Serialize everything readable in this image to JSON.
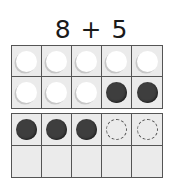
{
  "title": "8 + 5",
  "colors": {
    "counter_white": "#ffffff",
    "counter_dark": "#3e3e3e",
    "counter_dashed_outline": "#555555",
    "cell_background": "#ebebeb",
    "grid_lines": "#555555"
  },
  "frames": [
    {
      "name": "first-ten-frame",
      "rows": [
        [
          "white",
          "white",
          "white",
          "white",
          "white"
        ],
        [
          "white",
          "white",
          "white",
          "dark",
          "dark"
        ]
      ]
    },
    {
      "name": "second-ten-frame",
      "rows": [
        [
          "dark",
          "dark",
          "dark",
          "dashed",
          "dashed"
        ],
        [
          "empty",
          "empty",
          "empty",
          "empty",
          "empty"
        ]
      ]
    }
  ],
  "legend_note": {
    "white_counters": 8,
    "dark_counters": 5,
    "dashed_empty_spots": 2
  }
}
